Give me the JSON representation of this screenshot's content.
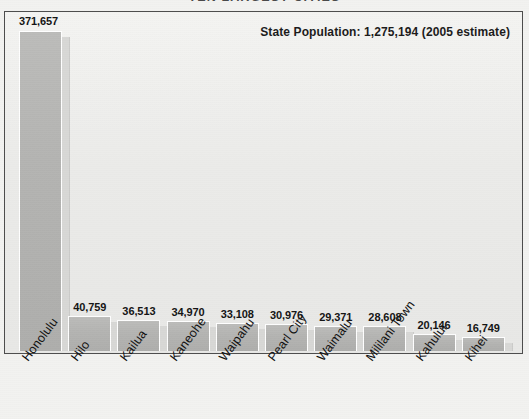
{
  "chart_data": {
    "type": "bar",
    "title": "TEN LARGEST CITIES",
    "xlabel": "",
    "ylabel": "",
    "ylim": [
      0,
      400000
    ],
    "grid": false,
    "legend": "none",
    "annotation": "State Population: 1,275,194 (2005 estimate)",
    "categories": [
      "Honolulu",
      "Hilo",
      "Kailua",
      "Kaneohe",
      "Waipahu",
      "Pearl City",
      "Waimalu",
      "Mililani Town",
      "Kahului",
      "Kihei"
    ],
    "values": [
      371657,
      40759,
      36513,
      34970,
      33108,
      30976,
      29371,
      28608,
      20146,
      16749
    ],
    "value_labels": [
      "371,657",
      "40,759",
      "36,513",
      "34,970",
      "33,108",
      "30,976",
      "29,371",
      "28,608",
      "20,146",
      "16,749"
    ]
  },
  "colors": {
    "bar_fill": "#b4b4b2",
    "bar_shadow": "#d8d8d6",
    "plot_background": "#ededeb",
    "page_background": "#f2f2f0",
    "frame_border": "#4c4c4c",
    "text": "#141414",
    "title_text": "#4a4a4a"
  }
}
